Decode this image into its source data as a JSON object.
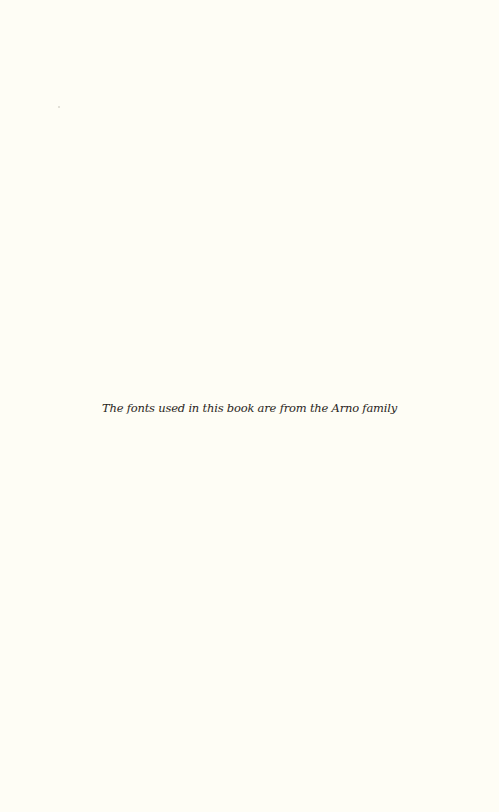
{
  "page": {
    "background_color": "#fefdf5",
    "text_color": "#2a2622",
    "colophon": "The fonts used in this book are from the Arno family"
  }
}
